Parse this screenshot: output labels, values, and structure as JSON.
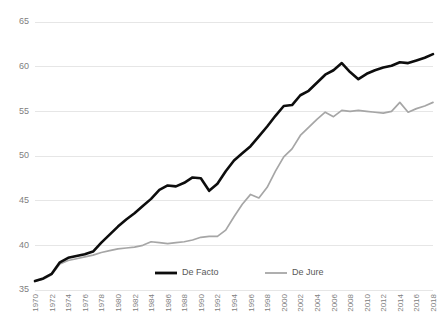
{
  "chart_data": {
    "type": "line",
    "title": "",
    "subtitle": "",
    "xlabel": "",
    "ylabel": "",
    "ylim": [
      35,
      65
    ],
    "xlim": [
      1970,
      2018
    ],
    "grid": true,
    "legend_position": "bottom-center",
    "ytick_labels": [
      "65",
      "60",
      "55",
      "50",
      "45",
      "40",
      "35"
    ],
    "ytick_values": [
      65,
      60,
      55,
      50,
      45,
      40,
      35
    ],
    "xtick_labels": [
      "1970",
      "1972",
      "1974",
      "1976",
      "1978",
      "1980",
      "1982",
      "1984",
      "1986",
      "1988",
      "1990",
      "1992",
      "1994",
      "1996",
      "1998",
      "2000",
      "2002",
      "2004",
      "2006",
      "2008",
      "2010",
      "2012",
      "2014",
      "2016",
      "2018"
    ],
    "x": [
      1970,
      1971,
      1972,
      1973,
      1974,
      1975,
      1976,
      1977,
      1978,
      1979,
      1980,
      1981,
      1982,
      1983,
      1984,
      1985,
      1986,
      1987,
      1988,
      1989,
      1990,
      1991,
      1992,
      1993,
      1994,
      1995,
      1996,
      1997,
      1998,
      1999,
      2000,
      2001,
      2002,
      2003,
      2004,
      2005,
      2006,
      2007,
      2008,
      2009,
      2010,
      2011,
      2012,
      2013,
      2014,
      2015,
      2016,
      2017,
      2018
    ],
    "series": [
      {
        "name": "De Facto",
        "color": "#0d0d0d",
        "values": [
          36.0,
          36.3,
          36.8,
          38.1,
          38.6,
          38.8,
          39.0,
          39.3,
          40.3,
          41.2,
          42.1,
          42.9,
          43.6,
          44.4,
          45.2,
          46.2,
          46.7,
          46.6,
          47.0,
          47.6,
          47.5,
          46.1,
          46.9,
          48.3,
          49.5,
          50.3,
          51.1,
          52.2,
          53.3,
          54.5,
          55.6,
          55.7,
          56.8,
          57.3,
          58.2,
          59.1,
          59.6,
          60.4,
          59.4,
          58.6,
          59.2,
          59.6,
          59.9,
          60.1,
          60.5,
          60.4,
          60.7,
          61.0,
          61.4
        ]
      },
      {
        "name": "De Jure",
        "color": "#a6a6a6",
        "values": [
          36.0,
          36.2,
          36.7,
          37.9,
          38.3,
          38.5,
          38.7,
          38.9,
          39.2,
          39.4,
          39.6,
          39.7,
          39.8,
          40.0,
          40.4,
          40.3,
          40.2,
          40.3,
          40.4,
          40.6,
          40.9,
          41.0,
          41.0,
          41.7,
          43.2,
          44.6,
          45.7,
          45.3,
          46.5,
          48.3,
          49.9,
          50.8,
          52.3,
          53.2,
          54.1,
          54.9,
          54.4,
          55.1,
          55.0,
          55.1,
          55.0,
          54.9,
          54.8,
          55.0,
          56.0,
          54.9,
          55.3,
          55.6,
          56.0
        ]
      }
    ],
    "legend": [
      {
        "label": "De Facto",
        "color": "#0d0d0d",
        "style": "thick"
      },
      {
        "label": "De Jure",
        "color": "#a6a6a6",
        "style": "thin"
      }
    ]
  }
}
